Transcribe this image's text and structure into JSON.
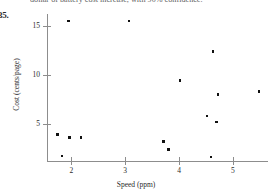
{
  "header": {
    "running_text": "dollar of battery cost increase, with 90% confidence.",
    "problem_number": "35."
  },
  "chart_data": {
    "type": "scatter",
    "title": "",
    "xlabel": "Speed (ppm)",
    "ylabel": "Cost (cents/page)",
    "xlim": [
      1.55,
      5.65
    ],
    "ylim": [
      1.2,
      16.2
    ],
    "xticks": [
      2,
      3,
      4,
      5
    ],
    "xtick_labels": [
      "2",
      "3",
      "4",
      "5"
    ],
    "yticks": [
      5,
      10,
      15
    ],
    "ytick_labels": [
      "5",
      "10",
      "15"
    ],
    "grid": false,
    "legend": null,
    "marker": "square",
    "marker_color": "#111111",
    "axis_color": "#8d8d8d",
    "points": [
      {
        "x": 1.95,
        "y": 15.5
      },
      {
        "x": 3.07,
        "y": 15.5
      },
      {
        "x": 4.63,
        "y": 12.4
      },
      {
        "x": 4.02,
        "y": 9.4
      },
      {
        "x": 4.72,
        "y": 8.0
      },
      {
        "x": 5.48,
        "y": 8.3
      },
      {
        "x": 4.52,
        "y": 5.8
      },
      {
        "x": 4.7,
        "y": 5.2
      },
      {
        "x": 1.75,
        "y": 3.9
      },
      {
        "x": 1.97,
        "y": 3.6
      },
      {
        "x": 2.18,
        "y": 3.6
      },
      {
        "x": 3.71,
        "y": 3.2
      },
      {
        "x": 3.8,
        "y": 2.4
      },
      {
        "x": 1.83,
        "y": 1.7
      },
      {
        "x": 4.59,
        "y": 1.6
      }
    ]
  }
}
